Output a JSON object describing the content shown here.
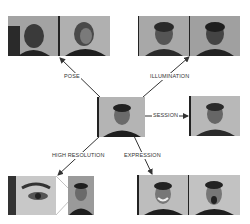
{
  "figure": {
    "center": {
      "label": "Neutral frontal reference image"
    },
    "branches": [
      {
        "id": "pose",
        "label": "POSE",
        "images": [
          "Profile view (left)",
          "Three-quarter view"
        ]
      },
      {
        "id": "illumination",
        "label": "ILLUMINATION",
        "images": [
          "Lighting condition A",
          "Lighting condition B"
        ]
      },
      {
        "id": "session",
        "label": "SESSION",
        "images": [
          "Different session frontal"
        ]
      },
      {
        "id": "high_resolution",
        "label": "HIGH RESOLUTION",
        "images": [
          "Eye close-up",
          "High-resolution portrait"
        ]
      },
      {
        "id": "expression",
        "label": "EXPRESSION",
        "images": [
          "Smile",
          "Scream"
        ]
      }
    ]
  },
  "colors": {
    "background": "#ffffff",
    "arrow": "#333333",
    "photo_bg": "#a9a9a9",
    "photo_dark": "#1e1e1e"
  }
}
